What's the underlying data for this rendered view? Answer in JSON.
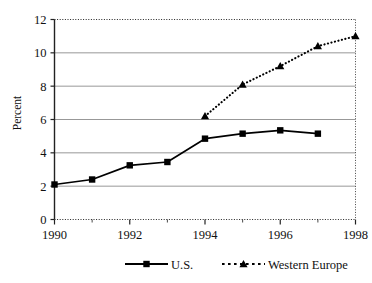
{
  "chart_data": {
    "type": "line",
    "title": "",
    "subtitle": "",
    "xlabel": "",
    "ylabel": "Percent",
    "xlim": [
      1990,
      1998
    ],
    "ylim": [
      0,
      12
    ],
    "yticks": [
      0,
      2,
      4,
      6,
      8,
      10,
      12
    ],
    "ytick_labels": [
      "0",
      "2",
      "4",
      "6",
      "8",
      "10",
      "12"
    ],
    "xticks": [
      1990,
      1992,
      1994,
      1996,
      1998
    ],
    "xtick_labels": [
      "1990",
      "1992",
      "1994",
      "1996",
      "1998"
    ],
    "x_minor_ticks": [
      1991,
      1993,
      1995,
      1997
    ],
    "grid": {
      "horizontal": true,
      "vertical": false,
      "color": "#8c8c8c"
    },
    "legend": {
      "position": "bottom",
      "entries": [
        {
          "name": "U.S.",
          "marker": "square",
          "line": "solid",
          "color": "#000000"
        },
        {
          "name": "Western Europe",
          "marker": "triangle",
          "line": "dotted",
          "color": "#000000"
        }
      ]
    },
    "series": [
      {
        "name": "U.S.",
        "marker": "square",
        "line": "solid",
        "color": "#000000",
        "x": [
          1990,
          1991,
          1992,
          1993,
          1994,
          1995,
          1996,
          1997
        ],
        "values": [
          2.1,
          2.4,
          3.25,
          3.45,
          4.85,
          5.15,
          5.35,
          5.15
        ]
      },
      {
        "name": "Western Europe",
        "marker": "triangle",
        "line": "dotted",
        "color": "#000000",
        "x": [
          1994,
          1995,
          1996,
          1997,
          1998
        ],
        "values": [
          6.2,
          8.1,
          9.2,
          10.4,
          11.0
        ]
      }
    ]
  },
  "legend": {
    "us_label": "U.S.",
    "we_label": "Western Europe"
  },
  "axes": {
    "y_title": "Percent"
  }
}
